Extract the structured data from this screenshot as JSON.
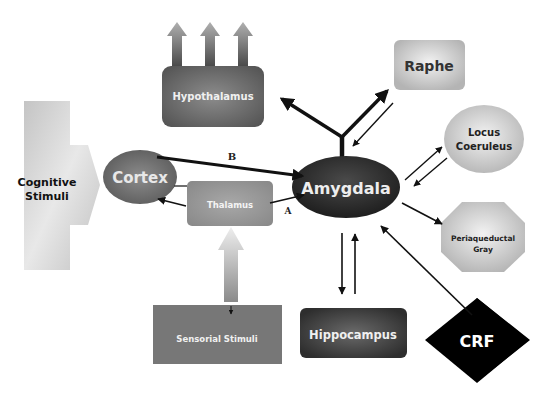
{
  "diagram": {
    "nodes": {
      "cognitive_stimuli": {
        "line1": "Cognitive",
        "line2": "Stimuli"
      },
      "cortex": {
        "label": "Cortex"
      },
      "thalamus": {
        "label": "Thalamus"
      },
      "amygdala": {
        "label": "Amygdala"
      },
      "hypothalamus": {
        "label": "Hypothalamus"
      },
      "raphe": {
        "label": "Raphe"
      },
      "locus_coeruleus": {
        "line1": "Locus",
        "line2": "Coeruleus"
      },
      "periaqueductal_gray": {
        "line1": "Periaqueductal",
        "line2": "Gray"
      },
      "sensorial_stimuli": {
        "label": "Sensorial Stimuli"
      },
      "hippocampus": {
        "label": "Hippocampus"
      },
      "crf": {
        "label": "CRF"
      }
    },
    "edge_labels": {
      "a": "A",
      "b": "B"
    },
    "edges": [
      {
        "from": "Cognitive Stimuli",
        "to": "Cortex"
      },
      {
        "from": "Cortex",
        "to": "Amygdala",
        "label": "B"
      },
      {
        "from": "Thalamus",
        "to": "Amygdala",
        "label": "A"
      },
      {
        "from": "Thalamus",
        "to": "Cortex"
      },
      {
        "from": "Sensorial Stimuli",
        "to": "Thalamus"
      },
      {
        "from": "Amygdala",
        "to": "Hypothalamus"
      },
      {
        "from": "Amygdala",
        "to": "Raphe"
      },
      {
        "from": "Raphe",
        "to": "Amygdala"
      },
      {
        "from": "Amygdala",
        "to": "Locus Coeruleus"
      },
      {
        "from": "Locus Coeruleus",
        "to": "Amygdala"
      },
      {
        "from": "Amygdala",
        "to": "Periaqueductal Gray"
      },
      {
        "from": "Amygdala",
        "to": "Hippocampus"
      },
      {
        "from": "Hippocampus",
        "to": "Amygdala"
      },
      {
        "from": "CRF",
        "to": "Amygdala"
      }
    ],
    "colors": {
      "amygdala": "#2e2e2e",
      "crf": "#000000",
      "cortex": "#6e6e6e",
      "thalamus": "#9a9a9a",
      "hypothalamus": "#555555",
      "hippocampus": "#5a5a5a",
      "sensorial": "#767676",
      "light_nodes": "#c8c8c8",
      "arrow": "#111111"
    }
  }
}
